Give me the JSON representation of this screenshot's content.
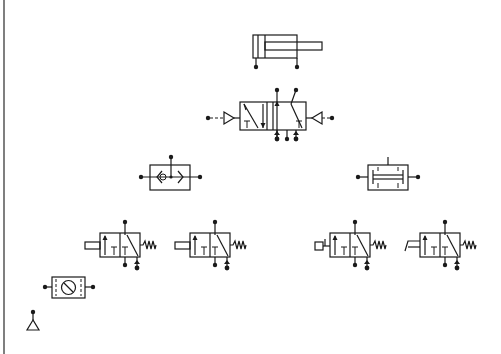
{
  "diagram": {
    "type": "pneumatic-circuit-components",
    "colors": {
      "background": "#ffffff",
      "line": "#1a1a1a",
      "left_border": "#555555"
    },
    "components": [
      {
        "id": "double-acting-cylinder",
        "label": "",
        "x": 253,
        "y": 35
      },
      {
        "id": "5-2-pilot-operated-valve",
        "label": "",
        "x": 240,
        "y": 102
      },
      {
        "id": "shuttle-valve-or",
        "label": "",
        "x": 150,
        "y": 165
      },
      {
        "id": "two-pressure-valve-and",
        "label": "",
        "x": 368,
        "y": 165
      },
      {
        "id": "3-2-valve-plunger-spring-1",
        "label": "",
        "x": 100,
        "y": 233
      },
      {
        "id": "3-2-valve-plunger-spring-2",
        "label": "",
        "x": 190,
        "y": 233
      },
      {
        "id": "3-2-valve-roller-spring",
        "label": "",
        "x": 330,
        "y": 233
      },
      {
        "id": "3-2-valve-idle-roller-spring",
        "label": "",
        "x": 420,
        "y": 233
      },
      {
        "id": "time-delay-gauge-unit",
        "label": "",
        "x": 52,
        "y": 277
      },
      {
        "id": "compressed-air-source",
        "label": "",
        "x": 33,
        "y": 312
      }
    ]
  }
}
